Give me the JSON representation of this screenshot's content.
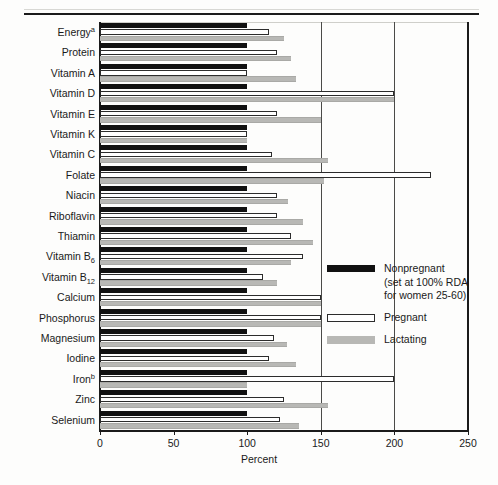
{
  "figure": {
    "x_axis_title": "Percent",
    "top_rule": "horizontal-rule"
  },
  "legend": {
    "position": "inside-right",
    "items": [
      {
        "key": "nonpregnant",
        "label": "Nonpregnant",
        "sub_line_1": "(set at 100% RDA",
        "sub_line_2": "for women 25-60)",
        "color": "#111111",
        "swatch": "filled-black-bar"
      },
      {
        "key": "pregnant",
        "label": "Pregnant",
        "color": "#ffffff",
        "swatch": "outlined-white-bar"
      },
      {
        "key": "lactating",
        "label": "Lactating",
        "color": "#b8b8b5",
        "swatch": "filled-gray-bar"
      }
    ]
  },
  "chart_data": {
    "type": "bar",
    "orientation": "horizontal",
    "title": "",
    "subtitle": "",
    "xlabel": "Percent",
    "ylabel": "",
    "xlim": [
      0,
      250
    ],
    "xticks": [
      0,
      50,
      100,
      150,
      200,
      250
    ],
    "xtick_labels": [
      "0",
      "50",
      "100",
      "150",
      "200",
      "250"
    ],
    "grid": "vertical-gridlines-at-150-and-200",
    "legend_position": "inside-right",
    "categories": [
      "Energyᵃ",
      "Protein",
      "Vitamin A",
      "Vitamin D",
      "Vitamin E",
      "Vitamin K",
      "Vitamin C",
      "Folate",
      "Niacin",
      "Riboflavin",
      "Thiamin",
      "Vitamin B6",
      "Vitamin B12",
      "Calcium",
      "Phosphorus",
      "Magnesium",
      "Iodine",
      "Ironᵇ",
      "Zinc",
      "Selenium"
    ],
    "category_labels": [
      {
        "text": "Energy",
        "sup": "a"
      },
      {
        "text": "Protein",
        "sup": ""
      },
      {
        "text": "Vitamin A",
        "sup": ""
      },
      {
        "text": "Vitamin D",
        "sup": ""
      },
      {
        "text": "Vitamin E",
        "sup": ""
      },
      {
        "text": "Vitamin K",
        "sup": ""
      },
      {
        "text": "Vitamin C",
        "sup": ""
      },
      {
        "text": "Folate",
        "sup": ""
      },
      {
        "text": "Niacin",
        "sup": ""
      },
      {
        "text": "Riboflavin",
        "sup": ""
      },
      {
        "text": "Thiamin",
        "sup": ""
      },
      {
        "text": "Vitamin B",
        "sub": "6"
      },
      {
        "text": "Vitamin B",
        "sub": "12"
      },
      {
        "text": "Calcium",
        "sup": ""
      },
      {
        "text": "Phosphorus",
        "sup": ""
      },
      {
        "text": "Magnesium",
        "sup": ""
      },
      {
        "text": "Iodine",
        "sup": ""
      },
      {
        "text": "Iron",
        "sup": "b"
      },
      {
        "text": "Zinc",
        "sup": ""
      },
      {
        "text": "Selenium",
        "sup": ""
      }
    ],
    "series": [
      {
        "name": "Nonpregnant",
        "color": "#111111",
        "values": [
          100,
          100,
          100,
          100,
          100,
          100,
          100,
          100,
          100,
          100,
          100,
          100,
          100,
          100,
          100,
          100,
          100,
          100,
          100,
          100
        ]
      },
      {
        "name": "Pregnant",
        "color": "#ffffff",
        "values": [
          115,
          120,
          100,
          200,
          120,
          100,
          117,
          225,
          120,
          120,
          130,
          138,
          111,
          150,
          150,
          118,
          115,
          200,
          125,
          122
        ]
      },
      {
        "name": "Lactating",
        "color": "#b8b8b5",
        "values": [
          125,
          130,
          133,
          200,
          150,
          100,
          155,
          152,
          128,
          138,
          145,
          130,
          120,
          150,
          150,
          127,
          133,
          100,
          155,
          135
        ]
      }
    ]
  }
}
